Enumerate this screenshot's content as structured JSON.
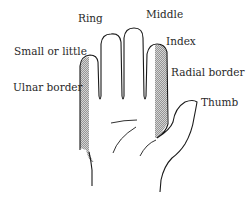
{
  "diagram": {
    "type": "hand-anatomy-labels",
    "labels": {
      "ring": "Ring",
      "middle": "Middle",
      "small": "Small or little",
      "index": "Index",
      "ulnar": "Ulnar border",
      "radial": "Radial border",
      "thumb": "Thumb"
    },
    "colors": {
      "outline": "#1a1a1a",
      "shading": "#8a8a8a",
      "text": "#2a2a2a",
      "background": "#ffffff"
    }
  }
}
